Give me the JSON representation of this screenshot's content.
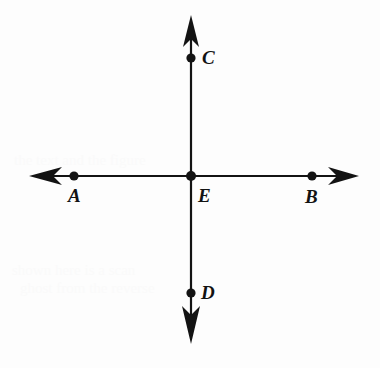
{
  "figure": {
    "background_color": "#fdfdfd",
    "ink_color": "#131313",
    "width": 380,
    "height": 368
  },
  "geometry": {
    "intersection": {
      "x": 191,
      "y": 176
    },
    "horizontal_line": {
      "name": "line-AB",
      "y": 176,
      "x_start": 30,
      "x_end": 358,
      "arrow_left": true,
      "arrow_right": true
    },
    "vertical_line": {
      "name": "line-CD",
      "x": 191,
      "y_start": 17,
      "y_end": 342,
      "arrow_up": true,
      "arrow_down": true
    },
    "stroke_width": 2,
    "dot_radius": 4.5
  },
  "points": [
    {
      "id": "A",
      "label": "A",
      "dot_x": 74,
      "dot_y": 176,
      "label_x": 68,
      "label_y": 186
    },
    {
      "id": "B",
      "label": "B",
      "dot_x": 312,
      "dot_y": 176,
      "label_x": 305,
      "label_y": 187
    },
    {
      "id": "C",
      "label": "C",
      "dot_x": 191,
      "dot_y": 58,
      "label_x": 202,
      "label_y": 48
    },
    {
      "id": "D",
      "label": "D",
      "dot_x": 191,
      "dot_y": 293,
      "label_x": 201,
      "label_y": 283
    },
    {
      "id": "E",
      "label": "E",
      "dot_x": 191,
      "dot_y": 176,
      "label_x": 198,
      "label_y": 186
    }
  ],
  "ghost_artifacts": [
    {
      "text": "the text and the figure",
      "x": 14,
      "y": 152
    },
    {
      "text": "shown here is a scan",
      "x": 12,
      "y": 262
    },
    {
      "text": "ghost from the reverse",
      "x": 20,
      "y": 280
    }
  ]
}
